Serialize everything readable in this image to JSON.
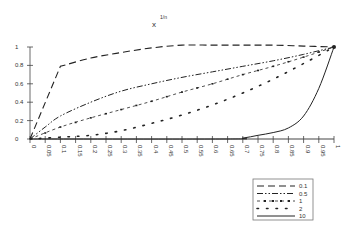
{
  "chart_data": {
    "type": "line",
    "title_base": "x",
    "title_superscript": "1/n",
    "xlabel": "",
    "ylabel": "",
    "xlim": [
      0,
      1
    ],
    "ylim": [
      0,
      1
    ],
    "grid": false,
    "legend_position": "bottom-right",
    "x_ticks": [
      "0",
      "0.05",
      "0.1",
      "0.15",
      "0.2",
      "0.25",
      "0.3",
      "0.35",
      "0.4",
      "0.45",
      "0.5",
      "0.55",
      "0.6",
      "0.65",
      "0.7",
      "0.75",
      "0.8",
      "0.85",
      "0.9",
      "0.95",
      "1"
    ],
    "y_ticks": [
      "0",
      "0.2",
      "0.4",
      "0.6",
      "0.8",
      "1"
    ],
    "x": [
      0,
      0.1,
      0.2,
      0.3,
      0.4,
      0.5,
      0.6,
      0.7,
      0.8,
      0.9,
      1
    ],
    "series": [
      {
        "name": "0.1",
        "style": "long-dash",
        "points": [
          [
            0,
            0
          ],
          [
            0.1,
            0.79
          ],
          [
            0.2,
            0.88
          ],
          [
            0.3,
            0.94
          ],
          [
            0.4,
            0.99
          ],
          [
            0.5,
            1.02
          ],
          [
            0.6,
            1.02
          ],
          [
            0.7,
            1.02
          ],
          [
            0.8,
            1.02
          ],
          [
            0.9,
            1.01
          ],
          [
            1,
            1
          ]
        ]
      },
      {
        "name": "0.5",
        "style": "dash-dot-dot",
        "points": [
          [
            0,
            0
          ],
          [
            0.05,
            0.13
          ],
          [
            0.1,
            0.25
          ],
          [
            0.2,
            0.4
          ],
          [
            0.3,
            0.52
          ],
          [
            0.4,
            0.6
          ],
          [
            0.5,
            0.67
          ],
          [
            0.6,
            0.73
          ],
          [
            0.7,
            0.79
          ],
          [
            0.8,
            0.85
          ],
          [
            0.9,
            0.92
          ],
          [
            1,
            1
          ]
        ]
      },
      {
        "name": "1",
        "style": "dash-dot-marker",
        "points": [
          [
            0,
            0
          ],
          [
            0.1,
            0.13
          ],
          [
            0.2,
            0.23
          ],
          [
            0.3,
            0.32
          ],
          [
            0.4,
            0.41
          ],
          [
            0.5,
            0.51
          ],
          [
            0.6,
            0.6
          ],
          [
            0.7,
            0.7
          ],
          [
            0.8,
            0.79
          ],
          [
            0.9,
            0.89
          ],
          [
            1,
            1
          ]
        ]
      },
      {
        "name": "2",
        "style": "dotted",
        "points": [
          [
            0,
            0
          ],
          [
            0.1,
            0.02
          ],
          [
            0.2,
            0.04
          ],
          [
            0.3,
            0.09
          ],
          [
            0.4,
            0.17
          ],
          [
            0.5,
            0.26
          ],
          [
            0.6,
            0.37
          ],
          [
            0.7,
            0.5
          ],
          [
            0.8,
            0.65
          ],
          [
            0.9,
            0.82
          ],
          [
            1,
            1
          ]
        ]
      },
      {
        "name": "10",
        "style": "solid",
        "points": [
          [
            0,
            0
          ],
          [
            0.65,
            0
          ],
          [
            0.7,
            0.01
          ],
          [
            0.75,
            0.04
          ],
          [
            0.8,
            0.07
          ],
          [
            0.85,
            0.12
          ],
          [
            0.9,
            0.25
          ],
          [
            0.95,
            0.55
          ],
          [
            1,
            1
          ]
        ]
      }
    ],
    "legend": [
      "0.1",
      "0.5",
      "1",
      "2",
      "10"
    ]
  },
  "colors": {
    "line": "#222222",
    "axis": "#444444",
    "text": "#333333",
    "background": "#ffffff"
  }
}
